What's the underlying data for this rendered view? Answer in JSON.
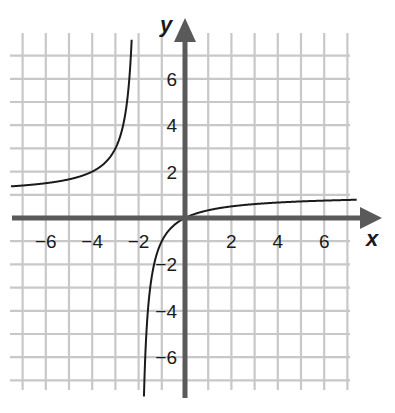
{
  "chart_data": {
    "type": "line",
    "title": "",
    "xlabel": "x",
    "ylabel": "y",
    "xlim": [
      -7.5,
      7.5
    ],
    "ylim": [
      -7.5,
      7.5
    ],
    "grid": true,
    "grid_step": 1,
    "x_ticks": [
      -6,
      -4,
      -2,
      2,
      4,
      6
    ],
    "y_ticks": [
      6,
      4,
      2,
      -2,
      -4,
      -6
    ],
    "x_tick_labels": [
      "−6",
      "−4",
      "−2",
      "2",
      "4",
      "6"
    ],
    "y_tick_labels": [
      "6",
      "4",
      "2",
      "−2",
      "−4",
      "−6"
    ],
    "function": "y = x / (x + 2)",
    "asymptotes": {
      "vertical": -2,
      "horizontal": 1
    },
    "series": [
      {
        "name": "left branch",
        "x": [
          -7.5,
          -7,
          -6,
          -5,
          -4,
          -3.5,
          -3,
          -2.75,
          -2.5,
          -2.4,
          -2.3
        ],
        "y": [
          1.36,
          1.4,
          1.5,
          1.67,
          2.0,
          2.33,
          3.0,
          3.67,
          5.0,
          6.0,
          7.67
        ]
      },
      {
        "name": "right branch",
        "x": [
          -1.76,
          -1.8,
          -1.75,
          -1.6,
          -1.5,
          -1.25,
          -1,
          -0.5,
          0,
          1,
          2,
          3,
          4,
          5,
          6,
          7,
          7.5
        ],
        "y": [
          -7.33,
          -9.0,
          -7.0,
          -4.0,
          -3.0,
          -1.67,
          -1.0,
          -0.33,
          0,
          0.33,
          0.5,
          0.6,
          0.67,
          0.71,
          0.75,
          0.78,
          0.79
        ]
      }
    ],
    "colors": {
      "grid": "#c8c8c8",
      "axes": "#5a5a5a",
      "curve": "#1a1a1a",
      "text": "#1a1a1a"
    }
  }
}
